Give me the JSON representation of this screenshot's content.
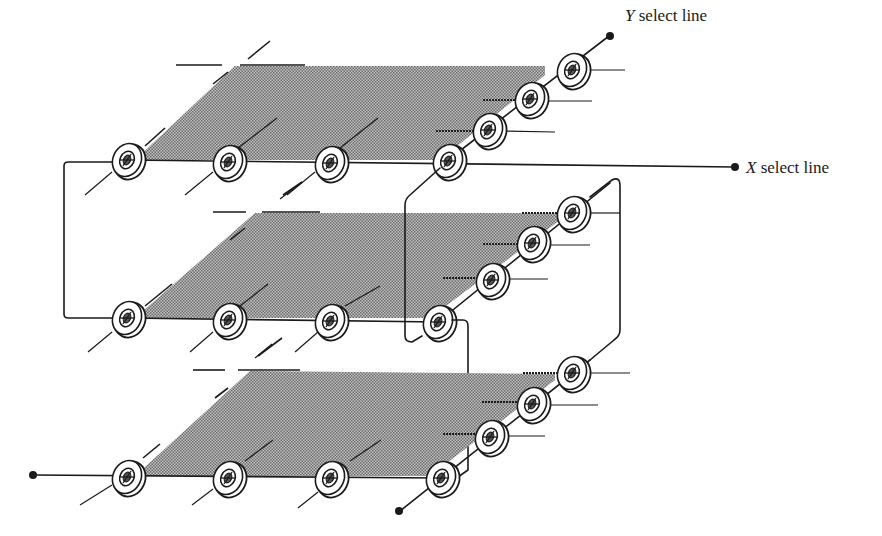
{
  "figure": {
    "type": "three-dimensional core memory stack diagram",
    "planes": 3,
    "cores_per_plane_visible": 7,
    "plane_fill_color": "#9a9a9a",
    "line_color": "#1a1a1a"
  },
  "labels": {
    "y_select": {
      "var": "Y",
      "text": " select line"
    },
    "x_select": {
      "var": "X",
      "text": " select line"
    }
  }
}
